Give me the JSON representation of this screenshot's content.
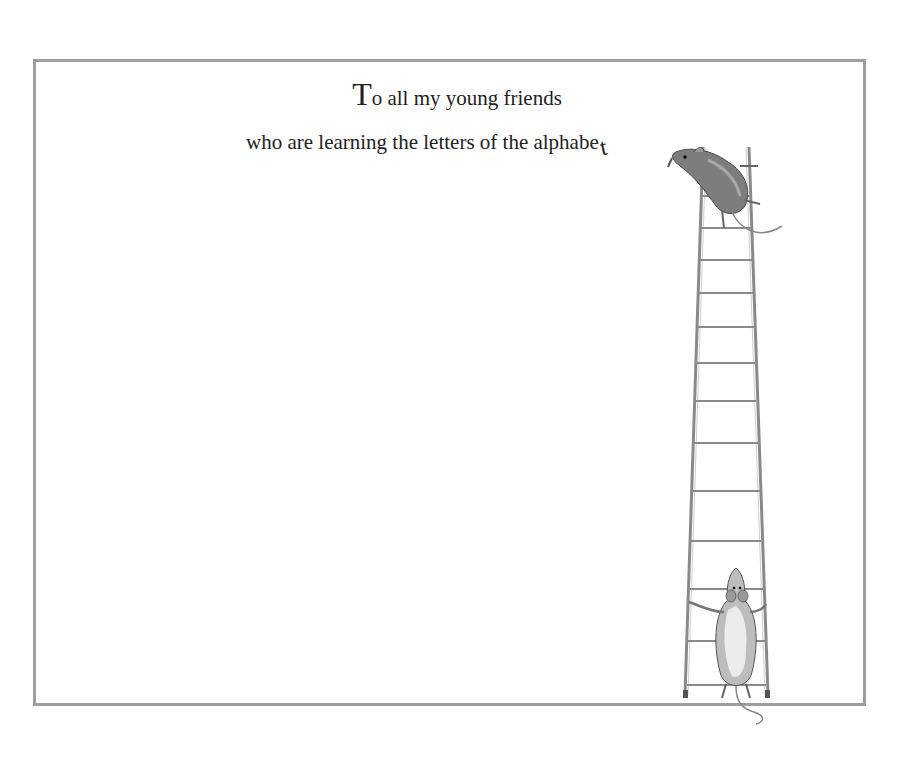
{
  "page": {
    "dedication": {
      "line1_initial": "T",
      "line1_rest": "o all my young friends",
      "line2": "who are learning the letters of the alphabe",
      "line2_trailing_letter": "t"
    },
    "illustration": {
      "subject": "two mice and a tall wooden ladder",
      "top_mouse": "mouse climbing at top of ladder, placing the letter t",
      "bottom_mouse": "mouse standing at foot of ladder holding the rails"
    },
    "colors": {
      "frame_border": "#9e9e9e",
      "text": "#222222",
      "ladder": "#8a8a8a",
      "background": "#ffffff"
    }
  }
}
